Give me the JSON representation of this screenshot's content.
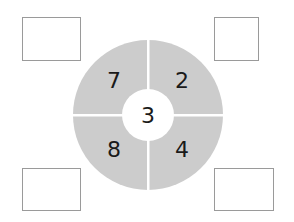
{
  "diagram": {
    "center_value": "3",
    "segments": [
      {
        "position": "top-left",
        "value": "7"
      },
      {
        "position": "top-right",
        "value": "2"
      },
      {
        "position": "bottom-left",
        "value": "8"
      },
      {
        "position": "bottom-right",
        "value": "4"
      }
    ],
    "answer_boxes": [
      {
        "position": "top-left",
        "value": ""
      },
      {
        "position": "top-right",
        "value": ""
      },
      {
        "position": "bottom-left",
        "value": ""
      },
      {
        "position": "bottom-right",
        "value": ""
      }
    ],
    "colors": {
      "ring": "#cccccc",
      "box_border": "#9a9a9a",
      "text": "#1a1a1a"
    }
  }
}
